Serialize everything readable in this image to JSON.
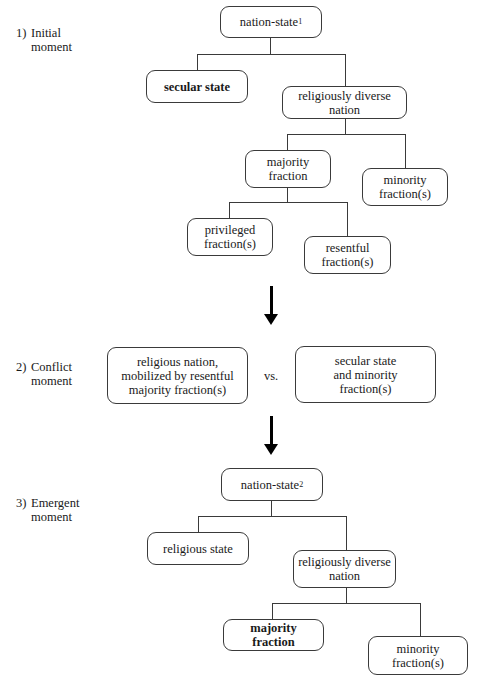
{
  "stages": [
    {
      "number": "1)",
      "line1": "Initial",
      "line2": "moment"
    },
    {
      "number": "2)",
      "line1": "Conflict",
      "line2": "moment"
    },
    {
      "number": "3)",
      "line1": "Emergent",
      "line2": "moment"
    }
  ],
  "initial": {
    "root": {
      "text": "nation-state",
      "sub": "1"
    },
    "secular_state": "secular state",
    "diverse_nation": "religiously diverse nation",
    "majority": {
      "line1": "majority",
      "line2": "fraction"
    },
    "minority": {
      "line1": "minority",
      "line2": "fraction(s)"
    },
    "privileged": {
      "line1": "privileged",
      "line2": "fraction(s)"
    },
    "resentful": {
      "line1": "resentful",
      "line2": "fraction(s)"
    }
  },
  "conflict": {
    "left": {
      "line1": "religious nation,",
      "line2": "mobilized by resentful",
      "line3": "majority fraction(s)"
    },
    "vs": "vs.",
    "right": {
      "line1": "secular state",
      "line2": "and minority",
      "line3": "fraction(s)"
    }
  },
  "emergent": {
    "root": {
      "text": "nation-state",
      "sub": "2"
    },
    "religious_state": "religious state",
    "diverse_nation": {
      "line1": "religiously diverse",
      "line2": "nation"
    },
    "majority": "majority fraction",
    "minority": {
      "line1": "minority",
      "line2": "fraction(s)"
    }
  }
}
